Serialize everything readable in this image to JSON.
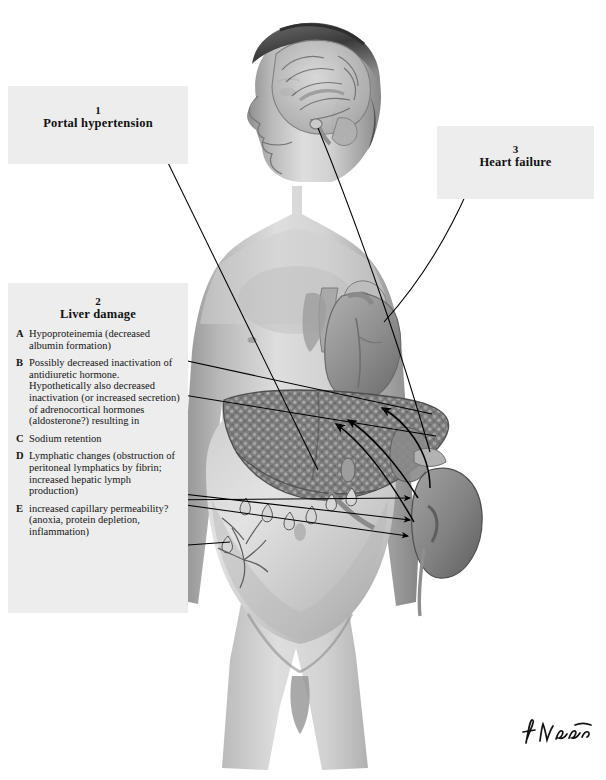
{
  "figure": {
    "signature": "F. Netter"
  },
  "callouts": [
    {
      "id": "portal",
      "number": "1",
      "title": "Portal hypertension"
    },
    {
      "id": "liver",
      "number": "2",
      "title": "Liver damage"
    },
    {
      "id": "heart",
      "number": "3",
      "title": "Heart failure"
    }
  ],
  "liver_damage_items": [
    {
      "letter": "A",
      "text": "Hypoproteinemia (decreased albumin formation)"
    },
    {
      "letter": "B",
      "text": "Possibly decreased inactivation of antidiuretic hormone. Hypothetically also decreased inactivation (or increased secretion) of adrenocortical hormones (aldosterone?) resulting in"
    },
    {
      "letter": "C",
      "text": "Sodium retention"
    },
    {
      "letter": "D",
      "text": "Lymphatic changes (obstruction of peritoneal lymphatics by fibrin; increased hepatic lymph production)"
    },
    {
      "letter": "E",
      "text": "increased capillary permeability? (anoxia, protein depletion, inflammation)"
    }
  ],
  "anatomy_labels": [
    "head-brain-sagittal",
    "pituitary-gland",
    "heart",
    "great-vessels",
    "cirrhotic-liver",
    "spleen",
    "kidney",
    "ascites-droplets",
    "peritoneal-capillary-network",
    "distended-abdomen"
  ],
  "colors": {
    "page_background": "#ffffff",
    "caption_box": "#ededed",
    "text": "#111111",
    "leader_line": "#000000"
  }
}
